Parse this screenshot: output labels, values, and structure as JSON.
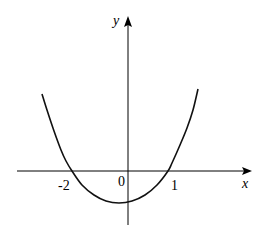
{
  "chart_data": {
    "type": "line",
    "title": "",
    "xlabel": "x",
    "ylabel": "y",
    "origin_label": "0",
    "tick_labels": [
      {
        "value": -2,
        "text": "-2"
      },
      {
        "value": 1,
        "text": "1"
      }
    ],
    "roots": [
      -2,
      1
    ],
    "vertex": {
      "x": -0.5,
      "y_sign": "negative"
    },
    "grid": false,
    "legend": "none",
    "series": [
      {
        "name": "parabola",
        "pixel_points": [
          [
            42,
            94
          ],
          [
            47,
            110
          ],
          [
            54,
            131
          ],
          [
            61,
            150
          ],
          [
            66,
            161
          ],
          [
            72,
            171
          ],
          [
            82,
            185
          ],
          [
            94,
            195
          ],
          [
            106,
            201
          ],
          [
            119,
            203
          ],
          [
            132,
            201
          ],
          [
            145,
            195
          ],
          [
            157,
            185
          ],
          [
            168,
            171
          ],
          [
            172,
            163
          ],
          [
            180,
            145
          ],
          [
            187,
            128
          ],
          [
            193,
            110
          ],
          [
            198,
            89
          ]
        ]
      }
    ]
  },
  "axes": {
    "x_axis": {
      "start": [
        17,
        171
      ],
      "end": [
        251,
        171
      ]
    },
    "y_axis": {
      "start": [
        128,
        225
      ],
      "end": [
        128,
        17
      ]
    }
  },
  "labels": {
    "y": "y",
    "x": "x",
    "origin": "0",
    "neg_two": "-2",
    "one": "1"
  }
}
